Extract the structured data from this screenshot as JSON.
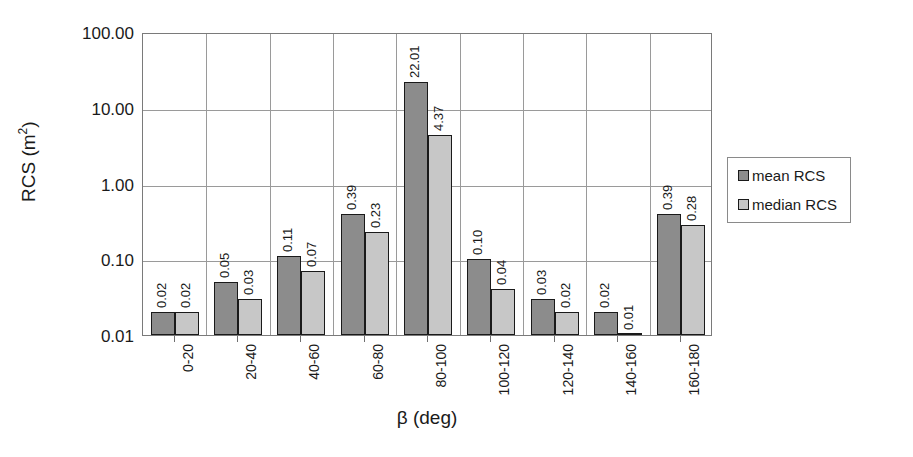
{
  "chart_data": {
    "type": "bar",
    "title": "",
    "xlabel": "β (deg)",
    "ylabel": "RCS (m²)",
    "yscale": "log",
    "ylim": [
      0.01,
      100
    ],
    "ytick_labels": [
      "100.00",
      "10.00",
      "1.00",
      "0.10",
      "0.01"
    ],
    "ytick_values": [
      100,
      10,
      1,
      0.1,
      0.01
    ],
    "grid": true,
    "legend_position": "right",
    "categories": [
      "0-20",
      "20-40",
      "40-60",
      "60-80",
      "80-100",
      "100-120",
      "120-140",
      "140-160",
      "160-180"
    ],
    "series": [
      {
        "name": "mean RCS",
        "color": "#8c8c8c",
        "values": [
          0.02,
          0.05,
          0.11,
          0.39,
          22.01,
          0.1,
          0.03,
          0.02,
          0.39
        ],
        "labels": [
          "0.02",
          "0.05",
          "0.11",
          "0.39",
          "22.01",
          "0.10",
          "0.03",
          "0.02",
          "0.39"
        ]
      },
      {
        "name": "median RCS",
        "color": "#c7c7c7",
        "values": [
          0.02,
          0.03,
          0.07,
          0.23,
          4.37,
          0.04,
          0.02,
          0.01,
          0.28
        ],
        "labels": [
          "0.02",
          "0.03",
          "0.07",
          "0.23",
          "4.37",
          "0.04",
          "0.02",
          "0.01",
          "0.28"
        ]
      }
    ]
  },
  "legend": {
    "items": [
      {
        "label": "mean RCS",
        "color": "#8c8c8c"
      },
      {
        "label": "median RCS",
        "color": "#c7c7c7"
      }
    ]
  },
  "axes": {
    "y_title_main": "RCS (m",
    "y_title_sup": "2",
    "y_title_tail": ")",
    "x_title": "β (deg)"
  }
}
